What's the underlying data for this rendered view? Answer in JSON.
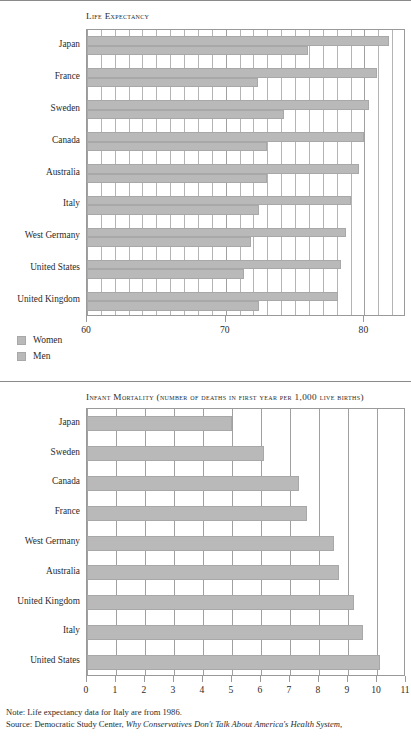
{
  "chart_data": [
    {
      "type": "bar",
      "orientation": "horizontal",
      "title": "Life Expectancy",
      "xlabel": "",
      "ylabel": "",
      "xlim": [
        60,
        83
      ],
      "tick_labels": [
        "60",
        "70",
        "80"
      ],
      "tick_values": [
        60,
        70,
        80
      ],
      "gridlines_every": 1,
      "grid": true,
      "legend": [
        "Women",
        "Men"
      ],
      "legend_position": "below-left",
      "categories": [
        "Japan",
        "France",
        "Sweden",
        "Canada",
        "Australia",
        "Italy",
        "West Germany",
        "United States",
        "United Kingdom"
      ],
      "series": [
        {
          "name": "Women",
          "values": [
            81.8,
            80.9,
            80.3,
            80.0,
            79.6,
            79.0,
            78.7,
            78.3,
            78.1
          ]
        },
        {
          "name": "Men",
          "values": [
            75.9,
            72.3,
            74.2,
            73.0,
            73.0,
            72.4,
            71.8,
            71.3,
            72.4
          ]
        }
      ]
    },
    {
      "type": "bar",
      "orientation": "horizontal",
      "title": "Infant Mortality",
      "title_suffix": "(number of deaths in first year per 1,000 live births)",
      "xlabel": "",
      "ylabel": "",
      "xlim": [
        0,
        11
      ],
      "tick_labels": [
        "0",
        "1",
        "2",
        "3",
        "4",
        "5",
        "6",
        "7",
        "8",
        "9",
        "10",
        "11"
      ],
      "tick_values": [
        0,
        1,
        2,
        3,
        4,
        5,
        6,
        7,
        8,
        9,
        10,
        11
      ],
      "gridlines_every": 1,
      "grid": true,
      "categories": [
        "Japan",
        "Sweden",
        "Canada",
        "France",
        "West Germany",
        "Australia",
        "United Kingdom",
        "Italy",
        "United States"
      ],
      "series": [
        {
          "name": "Infant mortality rate",
          "values": [
            5.0,
            6.1,
            7.3,
            7.6,
            8.5,
            8.7,
            9.2,
            9.5,
            10.1
          ]
        }
      ]
    }
  ],
  "footnotes": {
    "note": "Note: Life expectancy data for Italy are from 1986.",
    "source_prefix": "Source: Democratic Study Center, ",
    "source_title": "Why Conservatives Don't Talk About America's Health System,"
  }
}
